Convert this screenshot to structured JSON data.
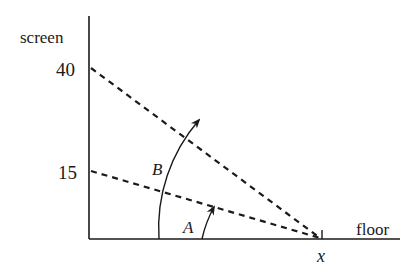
{
  "diagram": {
    "axis_labels": {
      "vertical": "screen",
      "horizontal": "floor"
    },
    "tick_labels": {
      "top": "40",
      "bottom": "15"
    },
    "point_label": "x",
    "angle_labels": {
      "large": "B",
      "small": "A"
    },
    "colors": {
      "stroke": "#1a1a1a",
      "background": "#ffffff"
    }
  }
}
